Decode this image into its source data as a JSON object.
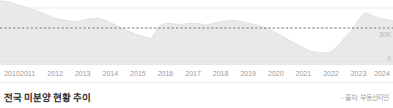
{
  "footer": {
    "title": "전국 미분양 현황 추이",
    "source": "- 출처: 부동산지인"
  },
  "axis": {
    "y_top_label": "50K",
    "y_zero_label": "0"
  },
  "colors": {
    "area_fill": "#e9e9e9",
    "area_stroke": "#dcdcdc",
    "gridline": "#ededed",
    "threshold_dash": "#6b6b6b",
    "baseline": "#e0e0e0",
    "tick_text": "#9a9a9a",
    "ylabel_text": "#b9b9b9",
    "title_text": "#2a2a2a",
    "source_text": "#a2a2a2",
    "background": "#ffffff"
  },
  "chart_data": {
    "type": "area",
    "title": "전국 미분양 현황 추이",
    "xlabel": "",
    "ylabel": "",
    "ylim": [
      0,
      90000
    ],
    "grid": true,
    "legend": null,
    "annotations": [
      {
        "kind": "threshold-line",
        "value": 50000,
        "label": "50K",
        "style": "dashed"
      }
    ],
    "tick_labels": [
      "2010",
      "2011",
      "2012",
      "2013",
      "2014",
      "2015",
      "2016",
      "2017",
      "2018",
      "2019",
      "2020",
      "2021",
      "2022",
      "2023",
      "2024"
    ],
    "x": [
      2010.0,
      2010.25,
      2010.5,
      2010.75,
      2011.0,
      2011.25,
      2011.5,
      2011.75,
      2012.0,
      2012.25,
      2012.5,
      2012.75,
      2013.0,
      2013.25,
      2013.5,
      2013.75,
      2014.0,
      2014.25,
      2014.5,
      2014.75,
      2015.0,
      2015.25,
      2015.5,
      2015.75,
      2016.0,
      2016.25,
      2016.5,
      2016.75,
      2017.0,
      2017.25,
      2017.5,
      2017.75,
      2018.0,
      2018.25,
      2018.5,
      2018.75,
      2019.0,
      2019.25,
      2019.5,
      2019.75,
      2020.0,
      2020.25,
      2020.5,
      2020.75,
      2021.0,
      2021.25,
      2021.5,
      2021.75,
      2022.0,
      2022.25,
      2022.5,
      2022.75,
      2023.0,
      2023.25,
      2023.5,
      2023.75,
      2024.0,
      2024.25
    ],
    "values": [
      89000,
      88000,
      85000,
      82000,
      79000,
      76000,
      72000,
      68000,
      64000,
      62000,
      60000,
      59000,
      61000,
      63000,
      64000,
      62000,
      58000,
      53000,
      48000,
      44000,
      40000,
      37000,
      35000,
      52000,
      57000,
      56000,
      55000,
      56000,
      57000,
      56000,
      54000,
      57000,
      59000,
      60000,
      61000,
      59000,
      57000,
      55000,
      52000,
      48000,
      43000,
      38000,
      32000,
      27000,
      22000,
      17000,
      15000,
      14000,
      16000,
      24000,
      36000,
      46000,
      62000,
      72000,
      68000,
      64000,
      62000,
      60000
    ],
    "series": [
      {
        "name": "전국 미분양 가구수",
        "values": [
          89000,
          88000,
          85000,
          82000,
          79000,
          76000,
          72000,
          68000,
          64000,
          62000,
          60000,
          59000,
          61000,
          63000,
          64000,
          62000,
          58000,
          53000,
          48000,
          44000,
          40000,
          37000,
          35000,
          52000,
          57000,
          56000,
          55000,
          56000,
          57000,
          56000,
          54000,
          57000,
          59000,
          60000,
          61000,
          59000,
          57000,
          55000,
          52000,
          48000,
          43000,
          38000,
          32000,
          27000,
          22000,
          17000,
          15000,
          14000,
          16000,
          24000,
          36000,
          46000,
          62000,
          72000,
          68000,
          64000,
          62000,
          60000
        ]
      }
    ]
  }
}
